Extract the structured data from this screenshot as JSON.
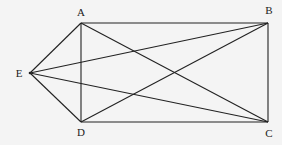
{
  "diagram": {
    "points": [
      {
        "id": "A",
        "x": 81,
        "y": 23,
        "label": "A",
        "lx": 81,
        "ly": 16
      },
      {
        "id": "B",
        "x": 268,
        "y": 23,
        "label": "B",
        "lx": 269,
        "ly": 14
      },
      {
        "id": "C",
        "x": 268,
        "y": 122,
        "label": "C",
        "lx": 269,
        "ly": 137
      },
      {
        "id": "D",
        "x": 81,
        "y": 122,
        "label": "D",
        "lx": 81,
        "ly": 136
      },
      {
        "id": "E",
        "x": 30,
        "y": 73,
        "label": "E",
        "lx": 19,
        "ly": 77
      }
    ],
    "segments": [
      [
        "A",
        "B"
      ],
      [
        "B",
        "C"
      ],
      [
        "C",
        "D"
      ],
      [
        "D",
        "A"
      ],
      [
        "E",
        "A"
      ],
      [
        "E",
        "D"
      ],
      [
        "E",
        "B"
      ],
      [
        "E",
        "C"
      ],
      [
        "A",
        "C"
      ],
      [
        "D",
        "B"
      ]
    ],
    "labels": {
      "A": "A",
      "B": "B",
      "C": "C",
      "D": "D",
      "E": "E"
    }
  }
}
